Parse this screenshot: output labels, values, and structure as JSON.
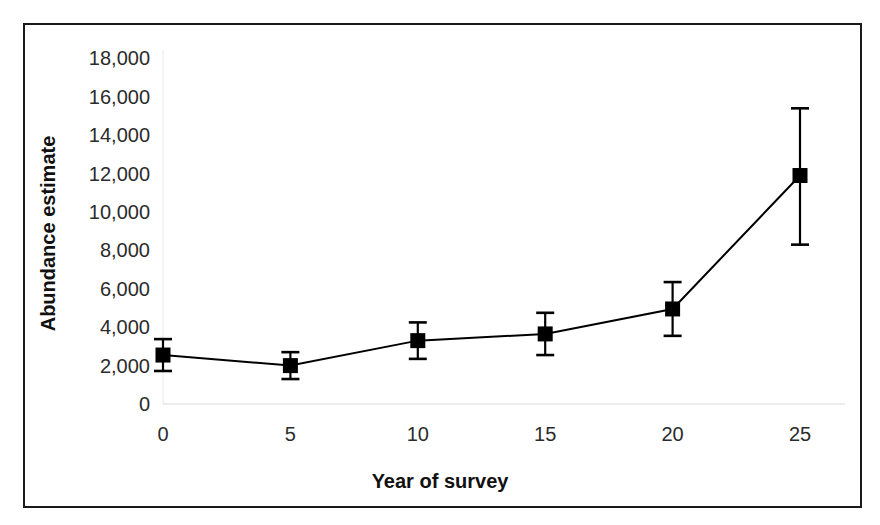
{
  "chart_data": {
    "type": "line",
    "title": "",
    "xlabel": "Year of survey",
    "ylabel": "Abundance estimate",
    "xlim": [
      -1.5,
      26.5
    ],
    "ylim": [
      0,
      18800
    ],
    "xticks": [
      0,
      5,
      10,
      15,
      20,
      25
    ],
    "xticklabels": [
      "0",
      "5",
      "10",
      "15",
      "20",
      "25"
    ],
    "yticks": [
      0,
      2000,
      4000,
      6000,
      8000,
      10000,
      12000,
      14000,
      16000,
      18000
    ],
    "yticklabels": [
      "0",
      "2,000",
      "4,000",
      "6,000",
      "8,000",
      "10,000",
      "12,000",
      "14,000",
      "16,000",
      "18,000"
    ],
    "grid": false,
    "legend": null,
    "marker": "square",
    "marker_color": "#000000",
    "line_color": "#000000",
    "errorbar_color": "#000000",
    "x": [
      0,
      5,
      10,
      15,
      20,
      25
    ],
    "values": [
      2550,
      2000,
      3300,
      3650,
      4950,
      11900
    ],
    "error_upper": [
      830,
      700,
      950,
      1100,
      1400,
      3500
    ],
    "error_lower": [
      830,
      700,
      950,
      1100,
      1400,
      3600
    ],
    "points": [
      {
        "x": 0,
        "y": 2550,
        "err_low": 1720,
        "err_high": 3380
      },
      {
        "x": 5,
        "y": 2000,
        "err_low": 1300,
        "err_high": 2700
      },
      {
        "x": 10,
        "y": 3300,
        "err_low": 2350,
        "err_high": 4250
      },
      {
        "x": 15,
        "y": 3650,
        "err_low": 2550,
        "err_high": 4750
      },
      {
        "x": 20,
        "y": 4950,
        "err_low": 3550,
        "err_high": 6350
      },
      {
        "x": 25,
        "y": 11900,
        "err_low": 8300,
        "err_high": 15400
      }
    ]
  },
  "figure": {
    "border_color": "#1a1a1a",
    "axis_color": "#d9d9d9",
    "background": "#ffffff"
  }
}
